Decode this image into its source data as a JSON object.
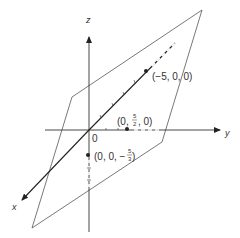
{
  "figure": {
    "type": "3d-coordinate-diagram",
    "axes": {
      "x": {
        "label": "x"
      },
      "y": {
        "label": "y"
      },
      "z": {
        "label": "z"
      },
      "origin": {
        "label": "0"
      }
    },
    "plane": {
      "description": "parallelogram plane intersecting the three axes"
    },
    "points": [
      {
        "label_prefix": "(−5, 0, 0)",
        "coords": [
          -5,
          0,
          0
        ]
      },
      {
        "label_prefix": "(0, ",
        "frac_num": "5",
        "frac_den": "2",
        "label_suffix": ", 0)",
        "coords": [
          0,
          2.5,
          0
        ]
      },
      {
        "label_prefix": "(0, 0, −",
        "frac_num": "5",
        "frac_den": "3",
        "label_suffix": ")",
        "coords": [
          0,
          0,
          -1.6667
        ]
      }
    ],
    "colors": {
      "line": "#333333",
      "plane": "#555555",
      "background": "#ffffff"
    }
  }
}
